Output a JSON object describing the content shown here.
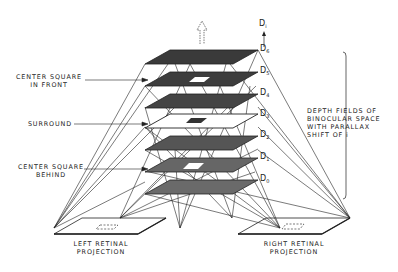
{
  "diagram": {
    "type": "stereopsis-depth-planes",
    "labels": {
      "center_front": [
        "CENTER SQUARE",
        "IN FRONT"
      ],
      "surround": "SURROUND",
      "center_behind": [
        "CENTER SQUARE",
        "BEHIND"
      ],
      "depth_fields": [
        "DEPTH FIELDS OF",
        "BINOCULAR SPACE",
        "WITH PARALLAX",
        "SHIFT OF i"
      ],
      "left_retina": [
        "LEFT RETINAL",
        "PROJECTION"
      ],
      "right_retina": [
        "RIGHT RETINAL",
        "PROJECTION"
      ],
      "depth_axis": "D",
      "depth_axis_sub": "i"
    },
    "planes": [
      {
        "id": "D6",
        "base": "D",
        "sub": "6",
        "fill": "#3a3a3a",
        "center": "none"
      },
      {
        "id": "D5",
        "base": "D",
        "sub": "5",
        "fill": "#3d3d3d",
        "center": "white"
      },
      {
        "id": "D4",
        "base": "D",
        "sub": "4",
        "fill": "#444444",
        "center": "none"
      },
      {
        "id": "D3",
        "base": "D",
        "sub": "3",
        "fill": "#ffffff",
        "center": "dark"
      },
      {
        "id": "D2",
        "base": "D",
        "sub": "2",
        "fill": "#555555",
        "center": "none"
      },
      {
        "id": "D1",
        "base": "D",
        "sub": "1",
        "fill": "#666666",
        "center": "white"
      },
      {
        "id": "D0",
        "base": "D",
        "sub": "0",
        "fill": "#6a6a6a",
        "center": "none"
      }
    ],
    "colors": {
      "ink": "#222222",
      "background": "#ffffff"
    }
  }
}
